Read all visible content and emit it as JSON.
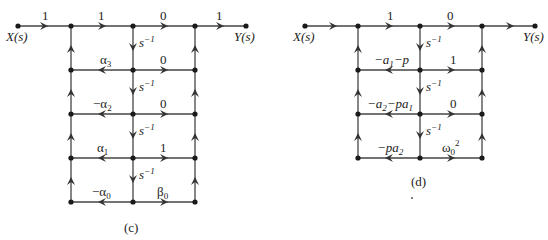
{
  "diagrams": [
    {
      "id": "c",
      "caption": "(c)",
      "input_label": "X(s)",
      "output_label": "Y(s)",
      "top_gains": [
        "1",
        "1",
        "0",
        "1"
      ],
      "integrator_label": "s",
      "integrator_exp": "−1",
      "rows": [
        {
          "left": "α",
          "left_sub": "3",
          "left_prefix": "",
          "right": "0",
          "right_sub": ""
        },
        {
          "left": "α",
          "left_sub": "2",
          "left_prefix": "−",
          "right": "0",
          "right_sub": ""
        },
        {
          "left": "α",
          "left_sub": "1",
          "left_prefix": "",
          "right": "1",
          "right_sub": ""
        },
        {
          "left": "α",
          "left_sub": "0",
          "left_prefix": "−",
          "right": "β",
          "right_sub": "0"
        }
      ]
    },
    {
      "id": "d",
      "caption": "(d)",
      "input_label": "X(s)",
      "output_label": "Y(s)",
      "top_gains": [
        "1",
        "0"
      ],
      "integrator_label": "s",
      "integrator_exp": "−1",
      "rows": [
        {
          "left_text": "−a",
          "left_sub": "1",
          "left_tail": "−p",
          "right": "1"
        },
        {
          "left_text": "−a",
          "left_sub": "2",
          "left_tail": "−pa",
          "left_tail_sub": "1",
          "right": "0"
        },
        {
          "left_text": "−pa",
          "left_sub": "2",
          "left_tail": "",
          "right": "ω",
          "right_sub": "0",
          "right_sup": "2"
        }
      ]
    }
  ],
  "colors": {
    "line": "#333333",
    "node": "#1a1a1a",
    "text": "#222222"
  }
}
